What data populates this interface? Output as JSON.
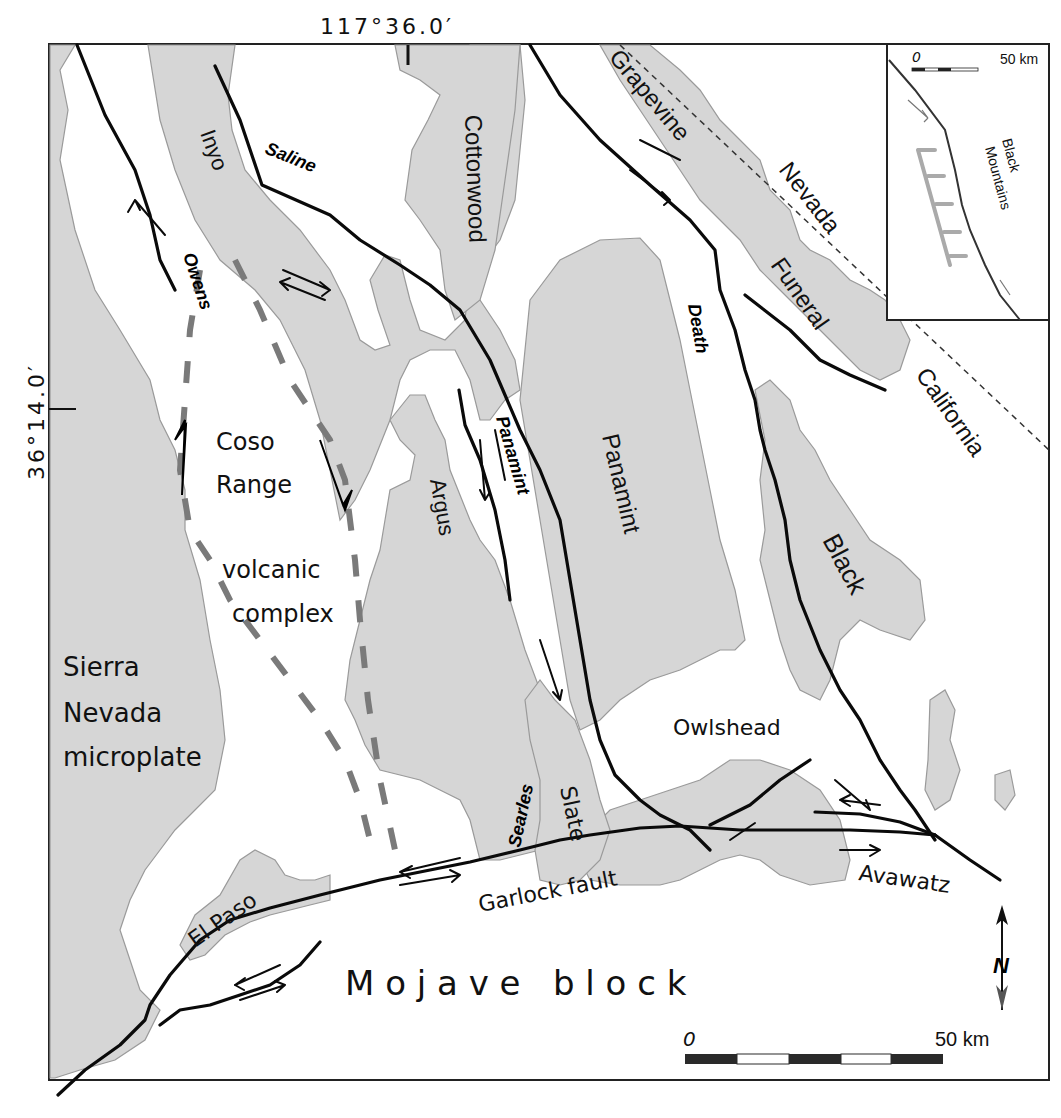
{
  "map": {
    "title": "Fault map of eastern California – Death Valley region",
    "coordinates": {
      "top_longitude": "117°36.0′",
      "left_latitude": "36°14.0′"
    },
    "fault_labels": {
      "owens": "Owens",
      "saline": "Saline",
      "panamint": "Panamint",
      "death": "Death",
      "searles": "Searles",
      "garlock": "Garlock fault"
    },
    "range_labels": {
      "inyo": "Inyo",
      "cottonwood": "Cottonwood",
      "grapevine": "Grapevine",
      "funeral": "Funeral",
      "argus": "Argus",
      "panamint_range": "Panamint",
      "black": "Black",
      "slate": "Slate",
      "owlshead": "Owlshead",
      "el_paso": "El Paso",
      "avawatz": "Avawatz"
    },
    "region_labels": {
      "coso_line1": "Coso",
      "coso_line2": "Range",
      "coso_line3": "volcanic",
      "coso_line4": "complex",
      "sierra_line1": "Sierra",
      "sierra_line2": "Nevada",
      "sierra_line3": "microplate",
      "mojave": "M o j a v e   b l o c k"
    },
    "state_labels": {
      "nevada": "Nevada",
      "california": "California"
    },
    "scale_bar": {
      "start": "0",
      "end": "50 km",
      "segments": 5
    },
    "north_arrow": {
      "label": "N"
    },
    "inset": {
      "label_line1": "Black",
      "label_line2": "Mountains",
      "scale_start": "0",
      "scale_end": "50 km"
    },
    "colors": {
      "range_fill": "#d6d6d6",
      "range_outline": "#9a9a9a",
      "fault": "#0a0a0a",
      "dashed_boundary": "#7a7a7a",
      "background": "#ffffff"
    }
  }
}
